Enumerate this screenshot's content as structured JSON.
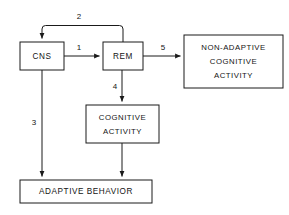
{
  "diagram": {
    "background_color": "#ffffff",
    "line_color": "#1a1a1a",
    "text_color": "#141414",
    "nodes": [
      {
        "id": "cns",
        "label": "CNS",
        "lines": [
          "CNS"
        ],
        "x": 20,
        "y": 42,
        "w": 44,
        "h": 28
      },
      {
        "id": "rem",
        "label": "REM",
        "lines": [
          "REM"
        ],
        "x": 103,
        "y": 42,
        "w": 40,
        "h": 28
      },
      {
        "id": "non_adaptive_cognitive_activity",
        "label": "NON-ADAPTIVE COGNITIVE ACTIVITY",
        "lines": [
          "NON-ADAPTIVE",
          "COGNITIVE",
          "ACTIVITY"
        ],
        "x": 184,
        "y": 35,
        "w": 99,
        "h": 53
      },
      {
        "id": "cognitive_activity",
        "label": "COGNITIVE ACTIVITY",
        "lines": [
          "COGNITIVE",
          "ACTIVITY"
        ],
        "x": 86,
        "y": 105,
        "w": 73,
        "h": 38
      },
      {
        "id": "adaptive_behavior",
        "label": "ADAPTIVE BEHAVIOR",
        "lines": [
          "ADAPTIVE  BEHAVIOR"
        ],
        "x": 20,
        "y": 180,
        "w": 132,
        "h": 23
      }
    ],
    "edges": [
      {
        "id": "edge-1",
        "number": "1",
        "from": "cns",
        "to": "rem",
        "label_x": 79,
        "label_y": 48
      },
      {
        "id": "edge-2",
        "number": "2",
        "from": "rem",
        "to": "cns",
        "label_x": 79,
        "label_y": 17
      },
      {
        "id": "edge-3",
        "number": "3",
        "from": "cns",
        "to": "adaptive_behavior",
        "label_x": 34,
        "label_y": 123
      },
      {
        "id": "edge-4",
        "number": "4",
        "from": "rem",
        "to": "cognitive_activity",
        "label_x": 115,
        "label_y": 87
      },
      {
        "id": "edge-5",
        "number": "5",
        "from": "rem",
        "to": "non_adaptive_cognitive_activity",
        "label_x": 163,
        "label_y": 48
      },
      {
        "id": "edge-unlabeled",
        "number": "",
        "from": "cognitive_activity",
        "to": "adaptive_behavior",
        "label_x": 0,
        "label_y": 0
      }
    ]
  }
}
